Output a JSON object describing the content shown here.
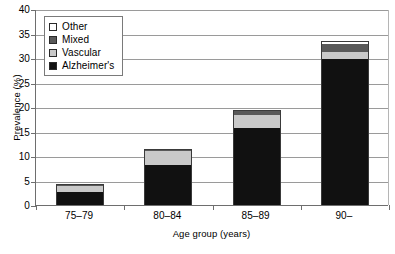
{
  "chart_data": {
    "type": "bar",
    "subtype": "stacked-vertical",
    "title": "",
    "xlabel": "Age group (years)",
    "ylabel": "Prevalence (%)",
    "categories": [
      "75–79",
      "80–84",
      "85–89",
      "90–"
    ],
    "ylim": [
      0,
      40
    ],
    "yticks": [
      0,
      5,
      10,
      15,
      20,
      25,
      30,
      35,
      40
    ],
    "ytick_labels": [
      "0",
      "5",
      "10",
      "15",
      "20",
      "25",
      "30",
      "35",
      "40"
    ],
    "grid": "horizontal",
    "legend_position": "top-left",
    "stack_order_bottom_to_top": [
      "Alzheimer's",
      "Vascular",
      "Mixed",
      "Other"
    ],
    "series": [
      {
        "name": "Alzheimer's",
        "color": "#111111",
        "values": [
          2.7,
          8.2,
          15.8,
          29.7
        ]
      },
      {
        "name": "Vascular",
        "color": "#c9c9c9",
        "values": [
          1.2,
          2.9,
          2.6,
          1.6
        ]
      },
      {
        "name": "Mixed",
        "color": "#595959",
        "values": [
          0.1,
          0.3,
          0.9,
          1.6
        ]
      },
      {
        "name": "Other",
        "color": "#ffffff",
        "values": [
          0.0,
          0.0,
          0.0,
          0.5
        ]
      }
    ],
    "totals": [
      4.0,
      11.4,
      19.3,
      33.4
    ]
  },
  "legend": {
    "items": [
      {
        "label": "Other",
        "color": "#ffffff"
      },
      {
        "label": "Mixed",
        "color": "#595959"
      },
      {
        "label": "Vascular",
        "color": "#c9c9c9"
      },
      {
        "label": "Alzheimer's",
        "color": "#111111"
      }
    ]
  },
  "axes": {
    "y_title": "Prevalence (%)",
    "x_title": "Age group (years)"
  },
  "colors": {
    "axis": "#6e6e6e",
    "gridline": "#9a9a9a",
    "bar_outline": "#3a3a3a",
    "background": "#ffffff"
  }
}
